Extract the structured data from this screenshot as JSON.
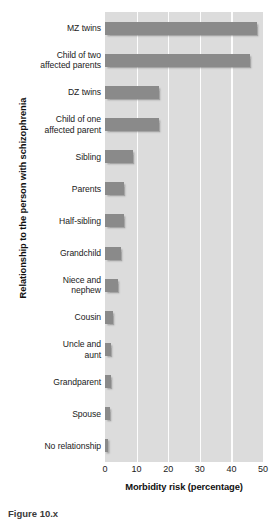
{
  "chart_data": {
    "type": "bar",
    "orientation": "horizontal",
    "title": "",
    "xlabel": "Morbidity risk (percentage)",
    "ylabel": "Relationship to the person with schizophrenia",
    "xlim": [
      0,
      50
    ],
    "xticks": [
      0,
      10,
      20,
      30,
      40,
      50
    ],
    "xtick_labels": [
      "0",
      "10",
      "20",
      "30",
      "40",
      "50"
    ],
    "grid": "vertical-only",
    "legend": "none",
    "bar_color": "#8a8a8a",
    "plot_background": "#dcdcdc",
    "gridline_color": "#fdfdfd",
    "categories": [
      "MZ twins",
      "Child of two affected parents",
      "DZ twins",
      "Child of one affected parent",
      "Sibling",
      "Parents",
      "Half-sibling",
      "Grandchild",
      "Niece and nephew",
      "Cousin",
      "Uncle and aunt",
      "Grandparent",
      "Spouse",
      "No relationship"
    ],
    "category_lines": [
      [
        "MZ twins"
      ],
      [
        "Child of two",
        "affected parents"
      ],
      [
        "DZ twins"
      ],
      [
        "Child of one",
        "affected parent"
      ],
      [
        "Sibling"
      ],
      [
        "Parents"
      ],
      [
        "Half-sibling"
      ],
      [
        "Grandchild"
      ],
      [
        "Niece and",
        "nephew"
      ],
      [
        "Cousin"
      ],
      [
        "Uncle and",
        "aunt"
      ],
      [
        "Grandparent"
      ],
      [
        "Spouse"
      ],
      [
        "No relationship"
      ]
    ],
    "values": [
      48,
      46,
      17,
      17,
      9,
      6,
      6,
      5,
      4,
      2.5,
      2,
      2,
      1.5,
      1
    ]
  },
  "caption": {
    "text": "Figure 10.x"
  }
}
